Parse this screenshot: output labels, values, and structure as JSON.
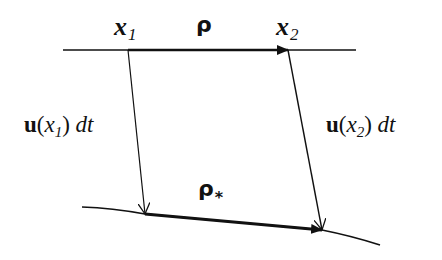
{
  "diagram": {
    "title": "",
    "labels": {
      "x1": {
        "main": "x",
        "sub": "1"
      },
      "x2": {
        "main": "x",
        "sub": "2"
      },
      "rho": "ρ",
      "rho_star": {
        "main": "ρ",
        "sub": "*"
      },
      "left_disp": {
        "u": "u",
        "open": "(",
        "var": "x",
        "sub": "1",
        "close": ")",
        "dt": " dt"
      },
      "right_disp": {
        "u": "u",
        "open": "(",
        "var": "x",
        "sub": "2",
        "close": ")",
        "dt": " dt"
      }
    },
    "elements": {
      "top_line": {
        "from": [
          63,
          50
        ],
        "to": [
          356,
          50
        ]
      },
      "top_arrow_rho": {
        "from": [
          128,
          50
        ],
        "to": [
          288,
          50
        ]
      },
      "left_displacement": {
        "from": [
          128,
          50
        ],
        "to": [
          145,
          214
        ]
      },
      "right_displacement": {
        "from": [
          288,
          50
        ],
        "to": [
          322,
          230
        ]
      },
      "bottom_curve": {
        "points": [
          [
            82,
            207
          ],
          [
            145,
            214
          ],
          [
            322,
            230
          ],
          [
            380,
            245
          ]
        ]
      },
      "bottom_arrow_rho_star": {
        "from": [
          145,
          214
        ],
        "to": [
          322,
          230
        ]
      }
    },
    "colors": {
      "ink": "#111111",
      "background": "#ffffff"
    }
  }
}
